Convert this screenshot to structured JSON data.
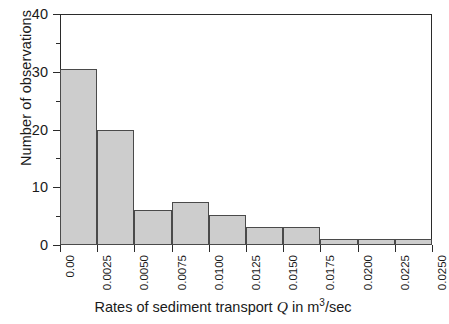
{
  "chart_data": {
    "type": "bar",
    "title": "",
    "subtitle": "",
    "xlabel_parts": {
      "before_var": "Rates of sediment transport ",
      "variable": "Q",
      "after_var": " in m",
      "exponent": "3",
      "tail": "/sec"
    },
    "xlabel": "Rates of sediment transport Q in m3/sec",
    "ylabel": "Number of observations",
    "categories": [
      "0.0000-0.0025",
      "0.0025-0.0050",
      "0.0050-0.0075",
      "0.0075-0.0100",
      "0.0100-0.0125",
      "0.0125-0.0150",
      "0.0150-0.0175",
      "0.0175-0.0200",
      "0.0200-0.0225",
      "0.0225-0.0250"
    ],
    "bin_edges": [
      0.0,
      0.0025,
      0.005,
      0.0075,
      0.01,
      0.0125,
      0.015,
      0.0175,
      0.02,
      0.0225,
      0.025
    ],
    "values": [
      30.5,
      20,
      6,
      7.5,
      5.2,
      3.2,
      3.2,
      1,
      1.1,
      1
    ],
    "bin_width": 0.0025,
    "xlim": [
      0.0,
      0.025
    ],
    "ylim": [
      0,
      40
    ],
    "x_tick_labels": [
      "0.00",
      "0.0025",
      "0.0050",
      "0.0075",
      "0.0100",
      "0.0125",
      "0.0150",
      "0.0175",
      "0.0200",
      "0.0225",
      "0.0250"
    ],
    "x_tick_values": [
      0.0,
      0.0025,
      0.005,
      0.0075,
      0.01,
      0.0125,
      0.015,
      0.0175,
      0.02,
      0.0225,
      0.025
    ],
    "y_tick_labels": [
      "0",
      "10",
      "20",
      "30",
      "40"
    ],
    "y_tick_values": [
      0,
      10,
      20,
      30,
      40
    ],
    "y_minor_tick_values": [
      5,
      15,
      25,
      35
    ],
    "grid": false,
    "legend": null,
    "legend_position": "none",
    "colors": {
      "bar_fill": "#cdcdcd",
      "bar_edge": "#4a4a4a",
      "axis": "#2b2b2b",
      "text": "#1a1a1a",
      "background": "#ffffff"
    }
  }
}
